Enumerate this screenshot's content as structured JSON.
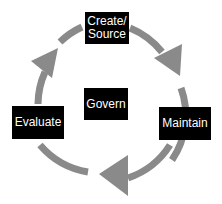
{
  "diagram": {
    "type": "cycle",
    "center": {
      "label": "Govern"
    },
    "stages": [
      {
        "label": "Create/\nSource",
        "line1": "Create/",
        "line2": "Source"
      },
      {
        "label": "Maintain"
      },
      {
        "label": "Evaluate"
      }
    ],
    "flow": [
      "Create/Source",
      "Maintain",
      "Evaluate",
      "Create/Source"
    ],
    "colors": {
      "arrow": "#8a8a8a",
      "box": "#000000",
      "text": "#ffffff"
    }
  }
}
